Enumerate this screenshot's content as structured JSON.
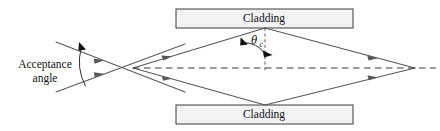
{
  "figure": {
    "background_color": "#ffffff",
    "width": 440,
    "height": 131
  },
  "labels": {
    "cladding_top": "Cladding",
    "cladding_bottom": "Cladding",
    "acceptance_line1": "Acceptance",
    "acceptance_line2": "angle",
    "theta_symbol": "θ",
    "theta_subscript": "c"
  },
  "colors": {
    "ray": "#58585a",
    "axis": "#3a3a3c",
    "cladding_fill": "#f3f3f3",
    "cladding_stroke": "#3c3c3e",
    "text": "#101012",
    "arrow": "#58585a"
  },
  "geometry": {
    "cladding_top_box": {
      "x": 176,
      "y": 9,
      "width": 177,
      "height": 19
    },
    "cladding_bottom_box": {
      "x": 176,
      "y": 105,
      "width": 177,
      "height": 19
    },
    "entrance_point": {
      "x": 133,
      "y": 68
    },
    "top_vertex": {
      "x": 265,
      "y": 28
    },
    "bottom_vertex": {
      "x": 265,
      "y": 105
    },
    "focus_point": {
      "x": 415,
      "y": 68
    },
    "axis_start_x": 133,
    "axis_end_x": 436,
    "axis_y": 68,
    "incoming_upper_start": {
      "x": 56,
      "y": 42
    },
    "incoming_lower_start": {
      "x": 56,
      "y": 92
    },
    "incoming_upper_end": {
      "x": 185,
      "y": 92
    },
    "incoming_lower_end": {
      "x": 185,
      "y": 44
    },
    "normal_line": {
      "x": 265,
      "y1": 28,
      "y2": 72
    },
    "acceptance_arc": {
      "cx": 133,
      "cy": 68,
      "radius": 52
    }
  },
  "annotations": {
    "acceptance_label_pos": {
      "x": 45,
      "y": 64
    },
    "theta_label_pos": {
      "x": 256,
      "y": 43
    },
    "cladding_top_label_pos": {
      "x": 264,
      "y": 19
    },
    "cladding_bottom_label_pos": {
      "x": 264,
      "y": 115
    }
  }
}
